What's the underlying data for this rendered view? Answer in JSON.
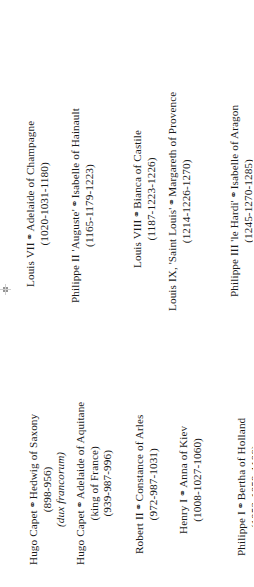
{
  "document": {
    "kind": "genealogy-table",
    "rotation_degrees": -90,
    "background_color": "#ffffff",
    "text_color": "#1a1a1a",
    "union_symbol": "⚭"
  },
  "groups": [
    {
      "id": "kings",
      "name": "capetian-kings-column",
      "entries": [
        {
          "id": "louis-vii",
          "person": "Louis VII",
          "symbol": "⚭",
          "spouse": "Adelaide of Champagne",
          "note": "",
          "dates": "(1020-1031-1180)"
        },
        {
          "id": "philippe-ii",
          "person": "Philippe II 'Auguste'",
          "symbol": "⚭",
          "spouse": "Isabelle of Hainault",
          "note": "",
          "dates": "(1165-1179-1223)"
        },
        {
          "id": "louis-viii",
          "person": "Louis VIII",
          "symbol": "⚭",
          "spouse": "Bianca of Castile",
          "note": "",
          "dates": "(1187-1223-1226)"
        },
        {
          "id": "louis-ix",
          "person": "Louis IX, 'Saint Louis'",
          "symbol": "⚭",
          "spouse": "Margareth of Provence",
          "note": "",
          "dates": "(1214-1226-1270)"
        },
        {
          "id": "philippe-iii",
          "person": "Philippe III 'le Hardi'",
          "symbol": "⚭",
          "spouse": "Isabelle of Aragon",
          "note": "",
          "dates": "(1245-1270-1285)"
        }
      ]
    },
    {
      "id": "consorts",
      "name": "early-capetians-column",
      "entries": [
        {
          "id": "hugo-capet-hedwig",
          "person": "Hugo Capet",
          "symbol": "⚭",
          "spouse": "Hedwig of Saxony",
          "note": "(dux francorum)",
          "dates": "(898-956)"
        },
        {
          "id": "hugo-capet-adelaide",
          "person": "Hugo Capet",
          "symbol": "⚭",
          "spouse": "Adelaide of Aquitane",
          "note": "(king of France)",
          "dates": "(939-987-996)"
        },
        {
          "id": "robert-ii",
          "person": "Robert II",
          "symbol": "⚭",
          "spouse": "Constance of Arles",
          "note": "",
          "dates": "(972-987-1031)"
        },
        {
          "id": "henry-i",
          "person": "Henry I",
          "symbol": "⚭",
          "spouse": "Anna of Kiev",
          "note": "",
          "dates": "(1008-1027-1060)"
        },
        {
          "id": "philippe-i",
          "person": "Philippe I",
          "symbol": "⚭",
          "spouse": "Bertha of Holland",
          "note": "",
          "dates": "(1052-1059-1108)"
        }
      ]
    }
  ]
}
